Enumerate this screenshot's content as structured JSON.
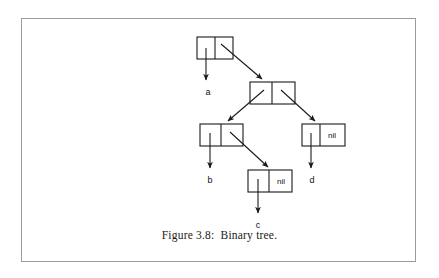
{
  "figure": {
    "caption": "Figure 3.8:  Binary tree.",
    "border_color": "#9b9b9b",
    "stroke_color": "#1a1a1a",
    "background": "#ffffff"
  },
  "diagram": {
    "type": "binary-tree-cons-cells",
    "nil_text": "nil",
    "nodes": [
      {
        "id": "root",
        "x": 197,
        "y": 37,
        "w": 36,
        "h": 22,
        "left_cell": "pointer",
        "right_cell": "pointer"
      },
      {
        "id": "node2",
        "x": 250,
        "y": 82,
        "w": 45,
        "h": 22,
        "left_cell": "pointer",
        "right_cell": "pointer"
      },
      {
        "id": "node3",
        "x": 200,
        "y": 124,
        "w": 43,
        "h": 22,
        "left_cell": "pointer",
        "right_cell": "pointer"
      },
      {
        "id": "node-d",
        "x": 302,
        "y": 124,
        "w": 43,
        "h": 22,
        "left_cell": "pointer",
        "right_cell": "nil"
      },
      {
        "id": "node-c",
        "x": 248,
        "y": 170,
        "w": 44,
        "h": 22,
        "left_cell": "pointer",
        "right_cell": "nil"
      }
    ],
    "leaf_labels": [
      {
        "id": "label-a",
        "text": "a",
        "x": 208,
        "y": 95
      },
      {
        "id": "label-b",
        "text": "b",
        "x": 210,
        "y": 183
      },
      {
        "id": "label-c",
        "text": "c",
        "x": 258,
        "y": 228
      },
      {
        "id": "label-d",
        "text": "d",
        "x": 312,
        "y": 183
      }
    ]
  }
}
